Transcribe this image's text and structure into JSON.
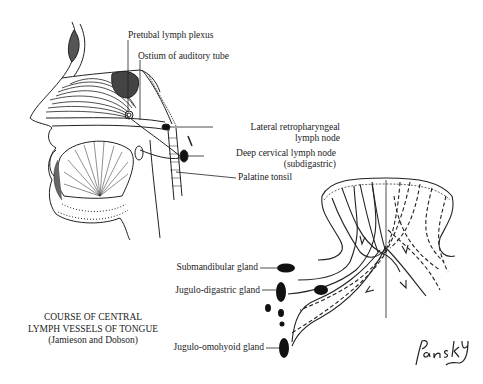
{
  "figure": {
    "caption": {
      "line1": "COURSE OF CENTRAL",
      "line2": "LYMPH VESSELS OF TONGUE",
      "line3": "(Jamieson and Dobson)"
    },
    "signature": "Pansky",
    "head_section_labels": {
      "pretubal": "Pretubal lymph plexus",
      "ostium": "Ostium of auditory tube",
      "lateral_retro_1": "Lateral retropharyngeal",
      "lateral_retro_2": "lymph node",
      "deep_cervical_1": "Deep cervical lymph node",
      "deep_cervical_2": "(subdigastric)",
      "palatine": "Palatine tonsil"
    },
    "tongue_section_labels": {
      "submandibular": "Submandibular gland",
      "jugulo_digastric": "Jugulo-digastric gland",
      "jugulo_omohyoid": "Jugulo-omohyoid gland"
    }
  }
}
